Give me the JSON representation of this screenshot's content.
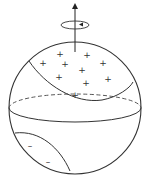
{
  "diagram": {
    "title": "",
    "stroke_color": "#333333",
    "background": "#ffffff",
    "sphere": {
      "cx": 75,
      "cy": 108,
      "r": 66
    },
    "equator": {
      "cx": 75,
      "cy": 108,
      "rx": 66,
      "ry": 14
    },
    "rotation_axis": {
      "x": 75,
      "y_top": 3,
      "y_bottom": 52,
      "arrow": "up"
    },
    "rotation_indicator": {
      "cx": 75,
      "cy": 25,
      "rx": 14,
      "ry": 4,
      "direction": "counterclockwise"
    },
    "positive_region": {
      "symbol": "+",
      "marks": [
        [
          60,
          54
        ],
        [
          87,
          55
        ],
        [
          43,
          63
        ],
        [
          65,
          64
        ],
        [
          103,
          63
        ],
        [
          82,
          70
        ],
        [
          59,
          77
        ],
        [
          108,
          79
        ],
        [
          86,
          83
        ],
        [
          75,
          95
        ]
      ]
    },
    "negative_region": {
      "symbol": "–",
      "marks": [
        [
          30,
          146
        ],
        [
          48,
          162
        ]
      ]
    }
  }
}
